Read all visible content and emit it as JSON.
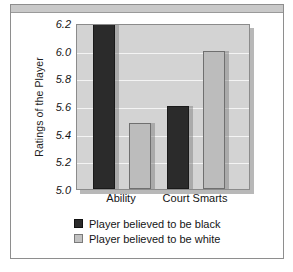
{
  "chart_data": {
    "type": "bar",
    "title": "",
    "subtitle": "",
    "xlabel": "",
    "ylabel": "Ratings of the Player",
    "categories": [
      "Ability",
      "Court Smarts"
    ],
    "series": [
      {
        "name": "Player believed to be black",
        "color": "#2b2b2b",
        "values": [
          6.2,
          5.6
        ]
      },
      {
        "name": "Player believed to be white",
        "color": "#bcbcbc",
        "values": [
          5.48,
          6.0
        ]
      }
    ],
    "ylim": [
      5.0,
      6.2
    ],
    "yticks": [
      "5.0",
      "5.2",
      "5.4",
      "5.6",
      "5.8",
      "6.0",
      "6.2"
    ],
    "ytick_values": [
      5.0,
      5.2,
      5.4,
      5.6,
      5.8,
      6.0,
      6.2
    ],
    "grid": true,
    "grid_axis": "y",
    "grid_color": "#f4f4f4",
    "legend_position": "bottom",
    "plot_background": "#d3d3d3",
    "frame_color": "#8e8e8e"
  },
  "legend": {
    "entries": [
      {
        "label": "Player believed to be black",
        "swatch": "black"
      },
      {
        "label": "Player believed to be white",
        "swatch": "white"
      }
    ]
  }
}
